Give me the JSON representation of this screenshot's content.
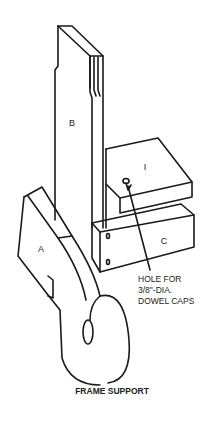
{
  "diagram": {
    "caption": "FRAME SUPPORT",
    "parts": {
      "a": "A",
      "b": "B",
      "c": "C",
      "i": "I"
    },
    "callout": {
      "line1": "HOLE FOR",
      "line2": "3/8\"-DIA.",
      "line3": "DOWEL CAPS"
    },
    "colors": {
      "ink": "#1a1a1a",
      "paper": "#ffffff"
    }
  }
}
